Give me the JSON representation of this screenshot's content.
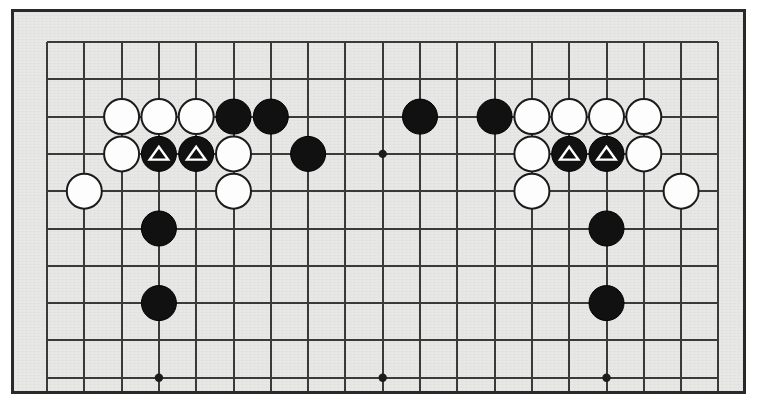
{
  "diagram": {
    "kind": "go-board-diagram",
    "colors": {
      "board_background": "#e8e8e6",
      "page_background": "#ffffff",
      "frame_border": "#2a2a2a",
      "grid_line": "#3a3a3a",
      "black_stone": "#111111",
      "white_stone": "#fdfdfd",
      "white_stone_outline": "#1b1b1b",
      "marker_stroke": "#ffffff",
      "star_point": "#1c1c1c"
    },
    "geometry": {
      "origin_x": 47,
      "origin_y": 42,
      "spacing": 37.3,
      "columns": 19,
      "visible_rows": 10,
      "stone_radius": 17.5,
      "star_radius": 4.2,
      "frame_left": 11,
      "frame_top": 9,
      "frame_width": 735,
      "frame_height": 385
    },
    "star_points": [
      {
        "col": 3,
        "row": 3
      },
      {
        "col": 9,
        "row": 3
      },
      {
        "col": 3,
        "row": 9
      },
      {
        "col": 9,
        "row": 9
      },
      {
        "col": 15,
        "row": 9
      }
    ],
    "stones": [
      {
        "col": 2,
        "row": 2,
        "color": "white",
        "marker": "none"
      },
      {
        "col": 3,
        "row": 2,
        "color": "white",
        "marker": "none"
      },
      {
        "col": 4,
        "row": 2,
        "color": "white",
        "marker": "none"
      },
      {
        "col": 5,
        "row": 2,
        "color": "black",
        "marker": "none"
      },
      {
        "col": 6,
        "row": 2,
        "color": "black",
        "marker": "none"
      },
      {
        "col": 10,
        "row": 2,
        "color": "black",
        "marker": "none"
      },
      {
        "col": 12,
        "row": 2,
        "color": "black",
        "marker": "none"
      },
      {
        "col": 13,
        "row": 2,
        "color": "white",
        "marker": "none"
      },
      {
        "col": 14,
        "row": 2,
        "color": "white",
        "marker": "none"
      },
      {
        "col": 15,
        "row": 2,
        "color": "white",
        "marker": "none"
      },
      {
        "col": 16,
        "row": 2,
        "color": "white",
        "marker": "none"
      },
      {
        "col": 2,
        "row": 3,
        "color": "white",
        "marker": "none"
      },
      {
        "col": 3,
        "row": 3,
        "color": "black",
        "marker": "triangle"
      },
      {
        "col": 4,
        "row": 3,
        "color": "black",
        "marker": "triangle"
      },
      {
        "col": 5,
        "row": 3,
        "color": "white",
        "marker": "none"
      },
      {
        "col": 7,
        "row": 3,
        "color": "black",
        "marker": "none"
      },
      {
        "col": 13,
        "row": 3,
        "color": "white",
        "marker": "none"
      },
      {
        "col": 14,
        "row": 3,
        "color": "black",
        "marker": "triangle"
      },
      {
        "col": 15,
        "row": 3,
        "color": "black",
        "marker": "triangle"
      },
      {
        "col": 16,
        "row": 3,
        "color": "white",
        "marker": "none"
      },
      {
        "col": 1,
        "row": 4,
        "color": "white",
        "marker": "none"
      },
      {
        "col": 5,
        "row": 4,
        "color": "white",
        "marker": "none"
      },
      {
        "col": 13,
        "row": 4,
        "color": "white",
        "marker": "none"
      },
      {
        "col": 17,
        "row": 4,
        "color": "white",
        "marker": "none"
      },
      {
        "col": 3,
        "row": 5,
        "color": "black",
        "marker": "none"
      },
      {
        "col": 15,
        "row": 5,
        "color": "black",
        "marker": "none"
      },
      {
        "col": 3,
        "row": 7,
        "color": "black",
        "marker": "none"
      },
      {
        "col": 15,
        "row": 7,
        "color": "black",
        "marker": "none"
      }
    ]
  }
}
